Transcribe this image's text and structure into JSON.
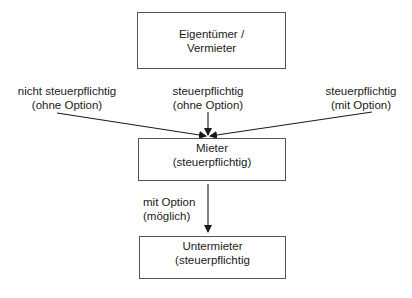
{
  "diagram": {
    "nodes": [
      {
        "id": "eigentuemer",
        "line1": "Eigentümer /",
        "line2": "Vermieter"
      },
      {
        "id": "mieter",
        "line1": "Mieter",
        "line2": "(steuerpflichtig)"
      },
      {
        "id": "untermieter",
        "line1": "Untermieter",
        "line2": "(steuerpflichtig"
      }
    ],
    "edge_labels": [
      {
        "id": "left",
        "line1": "nicht steuerpflichtig",
        "line2": "(ohne Option)"
      },
      {
        "id": "center",
        "line1": "steuerpflichtig",
        "line2": "(ohne Option)"
      },
      {
        "id": "right",
        "line1": "steuerpflichtig",
        "line2": "(mit Option)"
      },
      {
        "id": "down",
        "line1": "mit Option",
        "line2": "(möglich)"
      }
    ],
    "edges": [
      {
        "from": "left-label",
        "to": "mieter"
      },
      {
        "from": "center-label",
        "to": "mieter"
      },
      {
        "from": "right-label",
        "to": "mieter"
      },
      {
        "from": "mieter",
        "to": "untermieter",
        "label": "down"
      }
    ],
    "colors": {
      "line": "#1a1a1a",
      "border": "#555555",
      "background": "#ffffff"
    }
  }
}
